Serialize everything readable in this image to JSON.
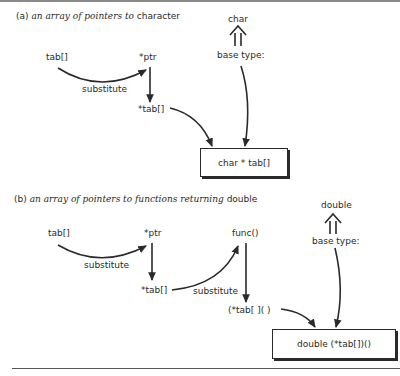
{
  "diagram_a": {
    "caption_prefix": "(a)",
    "caption_italic": "an array of pointers to",
    "caption_suffix": "character",
    "nodes": {
      "tab": "tab[]",
      "ptr": "*ptr",
      "star_tab": "*tab[]",
      "base_type_value": "char",
      "base_type_label": "base type:"
    },
    "edge_labels": {
      "substitute": "substitute"
    },
    "result_box": "char * tab[]"
  },
  "diagram_b": {
    "caption_prefix": "(b)",
    "caption_italic": "an array of pointers to functions returning",
    "caption_suffix": "double",
    "nodes": {
      "tab": "tab[]",
      "ptr": "*ptr",
      "star_tab": "*tab[]",
      "func": "func()",
      "star_tab_func": "(*tab[ ]( )",
      "base_type_value": "double",
      "base_type_label": "base type:"
    },
    "edge_labels": {
      "substitute_1": "substitute",
      "substitute_2": "substitute"
    },
    "result_box": "double (*tab[])()"
  },
  "colors": {
    "ink": "#2a2a2a",
    "top_border": "#8a8a8a",
    "background": "#ffffff"
  }
}
